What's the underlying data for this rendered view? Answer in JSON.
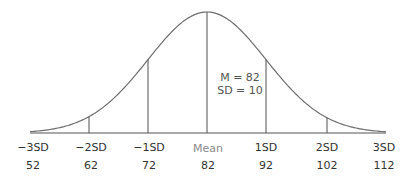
{
  "chart_data": {
    "type": "line",
    "title": "",
    "mean": 82,
    "sd": 10,
    "annotation": [
      "M = 82",
      "SD = 10"
    ],
    "sd_labels": [
      "−3SD",
      "−2SD",
      "−1SD",
      "Mean",
      "1SD",
      "2SD",
      "3SD"
    ],
    "values": [
      "52",
      "62",
      "72",
      "82",
      "92",
      "102",
      "112"
    ],
    "x": [
      52,
      62,
      72,
      82,
      92,
      102,
      112
    ],
    "xlabel": "",
    "ylabel": "",
    "grid": false,
    "colors": {
      "curve": "#707070",
      "lines": "#505050",
      "mean_label": "#8a8a8a"
    }
  },
  "annotation": {
    "line1": "M = 82",
    "line2": "SD = 10"
  },
  "labels": {
    "sd": [
      "−3SD",
      "−2SD",
      "−1SD",
      "Mean",
      "1SD",
      "2SD",
      "3SD"
    ],
    "values": [
      "52",
      "62",
      "72",
      "82",
      "92",
      "102",
      "112"
    ]
  }
}
